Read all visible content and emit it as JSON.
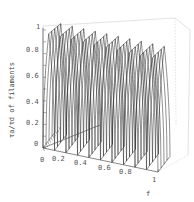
{
  "chart_data": {
    "type": "surface3d",
    "title": "",
    "xlabel": "f",
    "ylabel": "τa/τd of filaments",
    "zlabel": "",
    "x_ticks": [
      "0",
      "0.2",
      "0.4",
      "0.6",
      "0.8",
      "1"
    ],
    "y_ticks": [
      "0",
      "0.2",
      "0.4",
      "0.6",
      "0.8",
      "1"
    ],
    "depth_ticks": [
      "0.2",
      "0.4",
      "0.6",
      "0.8",
      "1"
    ],
    "xlim": [
      0,
      1
    ],
    "ylim": [
      0,
      1
    ],
    "grid": false,
    "style": "wireframe, black lines",
    "cusp_x_positions": [
      0.0,
      0.1,
      0.2,
      0.3,
      0.4,
      0.5,
      0.6,
      0.7,
      0.8,
      0.9,
      1.0
    ],
    "plateau_value_approx": 0.9
  },
  "axes": {
    "y_ticks": [
      "0",
      "0.2",
      "0.4",
      "0.6",
      "0.8",
      "1"
    ],
    "x_ticks": [
      "0",
      "0.2",
      "0.4",
      "0.6",
      "0.8",
      "1"
    ],
    "x_label": "f",
    "y_label": "τa/τd of filaments"
  }
}
